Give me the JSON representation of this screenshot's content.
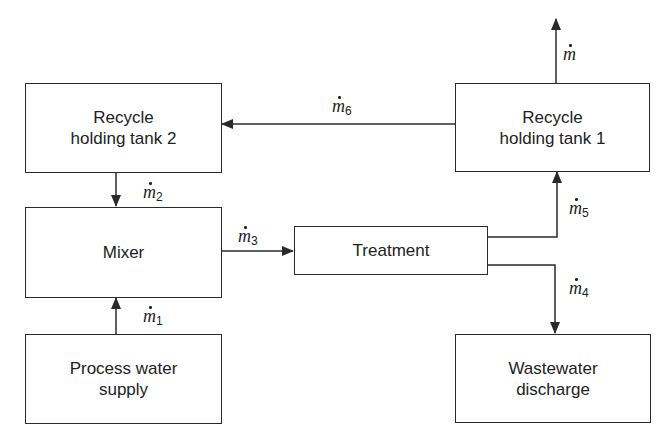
{
  "diagram": {
    "type": "process-flow",
    "nodes": {
      "recycle_tank_2": {
        "line1": "Recycle",
        "line2": "holding tank 2"
      },
      "recycle_tank_1": {
        "line1": "Recycle",
        "line2": "holding tank 1"
      },
      "mixer": {
        "label": "Mixer"
      },
      "treatment": {
        "label": "Treatment"
      },
      "process_water": {
        "line1": "Process water",
        "line2": "supply"
      },
      "wastewater": {
        "line1": "Wastewater",
        "line2": "discharge"
      }
    },
    "flows": {
      "m": {
        "symbol": "m",
        "subscript": ""
      },
      "m1": {
        "symbol": "m",
        "subscript": "1"
      },
      "m2": {
        "symbol": "m",
        "subscript": "2"
      },
      "m3": {
        "symbol": "m",
        "subscript": "3"
      },
      "m4": {
        "symbol": "m",
        "subscript": "4"
      },
      "m5": {
        "symbol": "m",
        "subscript": "5"
      },
      "m6": {
        "symbol": "m",
        "subscript": "6"
      }
    },
    "edges": [
      {
        "from": "process_water",
        "to": "mixer",
        "flow": "m1"
      },
      {
        "from": "recycle_tank_2",
        "to": "mixer",
        "flow": "m2"
      },
      {
        "from": "mixer",
        "to": "treatment",
        "flow": "m3"
      },
      {
        "from": "treatment",
        "to": "wastewater",
        "flow": "m4"
      },
      {
        "from": "treatment",
        "to": "recycle_tank_1",
        "flow": "m5"
      },
      {
        "from": "recycle_tank_1",
        "to": "recycle_tank_2",
        "flow": "m6"
      },
      {
        "from": "recycle_tank_1",
        "to": "outlet",
        "flow": "m"
      }
    ],
    "colors": {
      "line": "#2a2a2a",
      "background": "#ffffff",
      "text": "#222222"
    }
  }
}
